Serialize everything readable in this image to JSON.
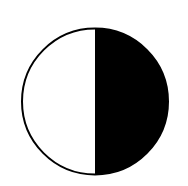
{
  "figure": {
    "shape": "circle",
    "center": [
      95,
      101.5
    ],
    "radius": 73,
    "stroke_width": 2,
    "colors": {
      "background": "#ffffff",
      "stroke": "#000000",
      "left_fill": "#ffffff",
      "right_fill": "#000000"
    },
    "segments": [
      {
        "name": "left-half",
        "fill": "white"
      },
      {
        "name": "right-half",
        "fill": "black"
      }
    ]
  }
}
